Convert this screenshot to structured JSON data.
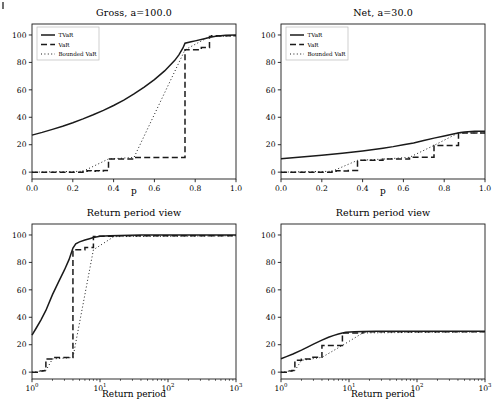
{
  "figure": {
    "width": 501,
    "height": 420,
    "background": "#ffffff",
    "line_color": "#1a1a1a"
  },
  "legend": {
    "entries": [
      {
        "label": "TVaR",
        "style": "solid"
      },
      {
        "label": "VaR",
        "style": "dashed"
      },
      {
        "label": "Bounded VaR",
        "style": "dotted"
      }
    ]
  },
  "chart_data": [
    {
      "id": "gross-probability",
      "type": "line",
      "title": "Gross, a=100.0",
      "xlabel": "p",
      "ylabel": "",
      "xscale": "linear",
      "yscale": "linear",
      "xlim": [
        0.0,
        1.0
      ],
      "ylim": [
        -5,
        108
      ],
      "xticks": [
        "0.0",
        "0.2",
        "0.4",
        "0.6",
        "0.8",
        "1.0"
      ],
      "xtick_values": [
        0.0,
        0.2,
        0.4,
        0.6,
        0.8,
        1.0
      ],
      "yticks": [
        "0",
        "20",
        "40",
        "60",
        "80",
        "100"
      ],
      "ytick_values": [
        0,
        20,
        40,
        60,
        80,
        100
      ],
      "grid": false,
      "legend_position": "upper left",
      "series": [
        {
          "name": "TVaR",
          "style": "solid",
          "x": [
            0.0,
            0.05,
            0.1,
            0.15,
            0.2,
            0.25,
            0.3,
            0.35,
            0.4,
            0.45,
            0.5,
            0.55,
            0.6,
            0.65,
            0.7,
            0.72,
            0.74,
            0.75,
            0.78,
            0.8,
            0.85,
            0.88,
            0.9,
            0.95,
            1.0
          ],
          "y": [
            27.0,
            29.0,
            31.2,
            33.5,
            36.0,
            38.8,
            41.8,
            45.0,
            48.6,
            52.5,
            57.0,
            62.0,
            67.5,
            73.8,
            81.5,
            85.5,
            90.5,
            94.0,
            95.0,
            95.7,
            97.5,
            98.6,
            99.1,
            99.8,
            100.0
          ]
        },
        {
          "name": "VaR",
          "style": "dashed",
          "x": [
            0.0,
            0.25,
            0.25,
            0.27,
            0.27,
            0.29,
            0.29,
            0.31,
            0.31,
            0.33,
            0.33,
            0.35,
            0.35,
            0.375,
            0.375,
            0.5,
            0.5,
            0.75,
            0.75,
            0.83,
            0.83,
            0.87,
            0.87,
            0.88,
            0.88,
            1.0
          ],
          "y": [
            0.0,
            0.0,
            0.7,
            0.7,
            1.1,
            1.1,
            0.7,
            0.7,
            1.1,
            1.1,
            0.8,
            0.8,
            1.2,
            1.2,
            9.6,
            9.6,
            10.7,
            10.7,
            89.2,
            89.2,
            90.8,
            90.8,
            98.8,
            98.8,
            99.4,
            99.4
          ]
        },
        {
          "name": "Bounded VaR",
          "style": "dotted",
          "x": [
            0.0,
            0.25,
            0.375,
            0.5,
            0.75,
            0.87,
            1.0
          ],
          "y": [
            0.0,
            0.6,
            9.6,
            10.7,
            89.2,
            98.8,
            99.4
          ]
        }
      ]
    },
    {
      "id": "net-probability",
      "type": "line",
      "title": "Net, a=30.0",
      "xlabel": "p",
      "ylabel": "",
      "xscale": "linear",
      "yscale": "linear",
      "xlim": [
        0.0,
        1.0
      ],
      "ylim": [
        -5,
        108
      ],
      "xticks": [
        "0.0",
        "0.2",
        "0.4",
        "0.6",
        "0.8",
        "1.0"
      ],
      "xtick_values": [
        0.0,
        0.2,
        0.4,
        0.6,
        0.8,
        1.0
      ],
      "yticks": [
        "0",
        "20",
        "40",
        "60",
        "80",
        "100"
      ],
      "ytick_values": [
        0,
        20,
        40,
        60,
        80,
        100
      ],
      "grid": false,
      "legend_position": "upper left",
      "series": [
        {
          "name": "TVaR",
          "style": "solid",
          "x": [
            0.0,
            0.1,
            0.2,
            0.3,
            0.4,
            0.5,
            0.55,
            0.6,
            0.65,
            0.7,
            0.75,
            0.8,
            0.85,
            0.88,
            0.9,
            0.95,
            1.0
          ],
          "y": [
            9.8,
            11.0,
            12.3,
            13.8,
            15.5,
            17.5,
            18.6,
            19.9,
            21.3,
            23.0,
            24.8,
            26.4,
            28.0,
            28.9,
            29.3,
            29.8,
            29.9
          ]
        },
        {
          "name": "VaR",
          "style": "dashed",
          "x": [
            0.0,
            0.25,
            0.25,
            0.27,
            0.27,
            0.3,
            0.3,
            0.33,
            0.33,
            0.375,
            0.375,
            0.5,
            0.5,
            0.63,
            0.63,
            0.75,
            0.75,
            0.87,
            0.87,
            1.0
          ],
          "y": [
            0.0,
            0.0,
            0.7,
            0.7,
            1.1,
            1.1,
            0.8,
            0.8,
            1.2,
            1.2,
            8.6,
            8.6,
            9.5,
            9.5,
            10.8,
            10.8,
            19.5,
            19.5,
            28.6,
            28.6
          ]
        },
        {
          "name": "Bounded VaR",
          "style": "dotted",
          "x": [
            0.0,
            0.25,
            0.375,
            0.5,
            0.63,
            0.75,
            0.87,
            1.0
          ],
          "y": [
            0.0,
            0.6,
            8.6,
            9.5,
            10.8,
            19.5,
            28.6,
            28.6
          ]
        }
      ]
    },
    {
      "id": "gross-return-period",
      "type": "line",
      "title": "Return period view",
      "xlabel": "Return period",
      "ylabel": "",
      "xscale": "log",
      "yscale": "linear",
      "xlim": [
        1,
        1000
      ],
      "ylim": [
        -5,
        108
      ],
      "xticks": [
        "10^0",
        "10^1",
        "10^2",
        "10^3"
      ],
      "xtick_values": [
        1,
        10,
        100,
        1000
      ],
      "yticks": [
        "0",
        "20",
        "40",
        "60",
        "80",
        "100"
      ],
      "ytick_values": [
        0,
        20,
        40,
        60,
        80,
        100
      ],
      "grid": false,
      "legend_position": "none",
      "series": [
        {
          "name": "TVaR",
          "style": "solid",
          "x": [
            1.0,
            1.15,
            1.35,
            1.6,
            2.0,
            2.5,
            3.0,
            3.5,
            4.0,
            4.4,
            5.0,
            6.0,
            7.0,
            8.0,
            10.0,
            14.0,
            20.0,
            40.0,
            100.0,
            300.0,
            1000.0
          ],
          "y": [
            27.0,
            32.0,
            38.0,
            45.0,
            56.5,
            66.5,
            74.5,
            82.0,
            90.5,
            93.6,
            95.0,
            96.3,
            97.3,
            98.2,
            99.0,
            99.4,
            99.7,
            99.9,
            100.0,
            100.0,
            100.0
          ]
        },
        {
          "name": "VaR",
          "style": "dashed",
          "x": [
            1.0,
            1.33,
            1.33,
            1.45,
            1.45,
            1.55,
            1.55,
            1.6,
            1.6,
            2.0,
            2.0,
            4.0,
            4.0,
            6.0,
            6.0,
            8.0,
            8.0,
            9.0,
            9.0,
            16.0,
            16.0,
            1000.0
          ],
          "y": [
            0.0,
            0.0,
            0.8,
            0.8,
            1.1,
            1.1,
            1.2,
            1.2,
            9.6,
            9.6,
            10.7,
            10.7,
            89.2,
            89.2,
            90.8,
            90.8,
            98.8,
            98.8,
            99.0,
            99.0,
            99.4,
            99.4
          ]
        },
        {
          "name": "Bounded VaR",
          "style": "dotted",
          "x": [
            1.0,
            1.6,
            2.0,
            4.0,
            8.0,
            16.0,
            1000.0
          ],
          "y": [
            0.0,
            1.2,
            9.6,
            10.7,
            89.2,
            98.8,
            99.4
          ]
        }
      ]
    },
    {
      "id": "net-return-period",
      "type": "line",
      "title": "Return period view",
      "xlabel": "Return period",
      "ylabel": "",
      "xscale": "log",
      "yscale": "linear",
      "xlim": [
        1,
        1000
      ],
      "ylim": [
        -5,
        108
      ],
      "xticks": [
        "10^0",
        "10^1",
        "10^2",
        "10^3"
      ],
      "xtick_values": [
        1,
        10,
        100,
        1000
      ],
      "yticks": [
        "0",
        "20",
        "40",
        "60",
        "80",
        "100"
      ],
      "ytick_values": [
        0,
        20,
        40,
        60,
        80,
        100
      ],
      "grid": false,
      "legend_position": "none",
      "series": [
        {
          "name": "TVaR",
          "style": "solid",
          "x": [
            1.0,
            1.2,
            1.5,
            2.0,
            2.5,
            3.0,
            4.0,
            5.0,
            6.0,
            7.0,
            8.0,
            9.0,
            12.0,
            16.0,
            25.0,
            60.0,
            200.0,
            1000.0
          ],
          "y": [
            9.8,
            11.3,
            13.2,
            16.0,
            18.4,
            20.4,
            23.3,
            25.4,
            26.8,
            27.8,
            28.6,
            29.0,
            29.5,
            29.7,
            29.9,
            29.9,
            29.9,
            29.9
          ]
        },
        {
          "name": "VaR",
          "style": "dashed",
          "x": [
            1.0,
            1.33,
            1.33,
            1.45,
            1.45,
            1.6,
            1.6,
            2.0,
            2.0,
            2.7,
            2.7,
            4.0,
            4.0,
            8.0,
            8.0,
            16.0,
            16.0,
            1000.0
          ],
          "y": [
            0.0,
            0.0,
            0.9,
            0.9,
            1.2,
            1.2,
            8.6,
            8.6,
            9.5,
            9.5,
            10.8,
            10.8,
            19.5,
            19.5,
            28.6,
            28.6,
            29.4,
            29.4
          ]
        },
        {
          "name": "Bounded VaR",
          "style": "dotted",
          "x": [
            1.0,
            1.6,
            2.0,
            2.7,
            4.0,
            8.0,
            16.0,
            1000.0
          ],
          "y": [
            0.0,
            1.2,
            8.6,
            9.5,
            10.8,
            19.5,
            28.6,
            29.4
          ]
        }
      ]
    }
  ]
}
